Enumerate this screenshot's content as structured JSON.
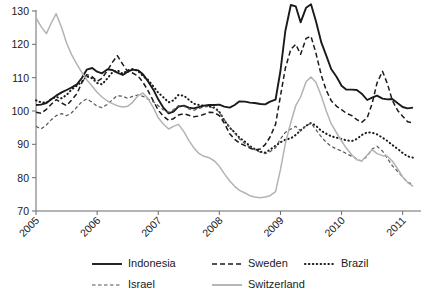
{
  "chart_data": {
    "type": "line",
    "title": "",
    "subtitle": "",
    "xlabel": "",
    "ylabel": "",
    "xlim": [
      2005.0,
      2011.3
    ],
    "ylim": [
      70,
      133
    ],
    "grid": false,
    "legend_position": "bottom",
    "xticks": [
      "2005",
      "2006",
      "2007",
      "2008",
      "2009",
      "2010",
      "2011"
    ],
    "xtick_values": [
      2005,
      2006,
      2007,
      2008,
      2009,
      2010,
      2011
    ],
    "yticks": [
      "70",
      "80",
      "90",
      "100",
      "110",
      "120",
      "130"
    ],
    "ytick_values": [
      70,
      80,
      90,
      100,
      110,
      120,
      130
    ],
    "colors": {
      "indonesia": "#1a1a1a",
      "sweden": "#1a1a1a",
      "brazil": "#1a1a1a",
      "israel": "#555555",
      "switzerland": "#b3b3b3",
      "axis": "#6b6b6b",
      "background": "#ffffff"
    },
    "series": [
      {
        "name": "Indonesia",
        "style": "solid",
        "color": "#1a1a1a",
        "width": 1.9,
        "x": [
          2005.0,
          2005.08,
          2005.17,
          2005.25,
          2005.33,
          2005.42,
          2005.5,
          2005.58,
          2005.67,
          2005.75,
          2005.83,
          2005.92,
          2006.0,
          2006.08,
          2006.17,
          2006.25,
          2006.33,
          2006.42,
          2006.5,
          2006.58,
          2006.67,
          2006.75,
          2006.83,
          2006.92,
          2007.0,
          2007.08,
          2007.17,
          2007.25,
          2007.33,
          2007.42,
          2007.5,
          2007.58,
          2007.67,
          2007.75,
          2007.83,
          2007.92,
          2008.0,
          2008.08,
          2008.17,
          2008.25,
          2008.33,
          2008.42,
          2008.5,
          2008.58,
          2008.67,
          2008.75,
          2008.83,
          2008.92,
          2009.0,
          2009.08,
          2009.17,
          2009.25,
          2009.33,
          2009.42,
          2009.5,
          2009.58,
          2009.67,
          2009.75,
          2009.83,
          2009.92,
          2010.0,
          2010.08,
          2010.17,
          2010.25,
          2010.33,
          2010.42,
          2010.5,
          2010.58,
          2010.67,
          2010.75,
          2010.83,
          2010.92,
          2011.0,
          2011.08,
          2011.17
        ],
        "values": [
          101.8,
          101.9,
          102.4,
          103.5,
          104.6,
          105.6,
          106.3,
          107.0,
          108.0,
          109.9,
          112.4,
          112.9,
          111.8,
          111.3,
          112.5,
          112.3,
          111.5,
          110.8,
          111.8,
          112.4,
          112.2,
          111.0,
          109.0,
          106.4,
          103.5,
          101.1,
          99.3,
          99.8,
          101.3,
          101.6,
          101.0,
          100.8,
          101.2,
          101.6,
          101.8,
          101.8,
          101.9,
          101.3,
          101.0,
          101.8,
          102.9,
          102.8,
          102.5,
          102.4,
          102.1,
          102.0,
          102.8,
          103.4,
          112.0,
          124.0,
          131.8,
          131.4,
          126.6,
          131.0,
          132.0,
          127.0,
          120.5,
          116.6,
          112.6,
          110.2,
          107.6,
          106.4,
          106.4,
          106.3,
          105.2,
          103.3,
          104.0,
          104.6,
          103.7,
          103.5,
          103.6,
          102.3,
          101.2,
          100.8,
          101.0
        ]
      },
      {
        "name": "Sweden",
        "style": "dashed",
        "color": "#1a1a1a",
        "width": 1.5,
        "dash": "5,3",
        "x": [
          2005.0,
          2005.08,
          2005.17,
          2005.25,
          2005.33,
          2005.42,
          2005.5,
          2005.58,
          2005.67,
          2005.75,
          2005.83,
          2005.92,
          2006.0,
          2006.08,
          2006.17,
          2006.25,
          2006.33,
          2006.42,
          2006.5,
          2006.58,
          2006.67,
          2006.75,
          2006.83,
          2006.92,
          2007.0,
          2007.08,
          2007.17,
          2007.25,
          2007.33,
          2007.42,
          2007.5,
          2007.58,
          2007.67,
          2007.75,
          2007.83,
          2007.92,
          2008.0,
          2008.08,
          2008.17,
          2008.25,
          2008.33,
          2008.42,
          2008.5,
          2008.58,
          2008.67,
          2008.75,
          2008.83,
          2008.92,
          2009.0,
          2009.08,
          2009.17,
          2009.25,
          2009.33,
          2009.42,
          2009.5,
          2009.58,
          2009.67,
          2009.75,
          2009.83,
          2009.92,
          2010.0,
          2010.08,
          2010.17,
          2010.25,
          2010.33,
          2010.42,
          2010.5,
          2010.58,
          2010.67,
          2010.75,
          2010.83,
          2010.92,
          2011.0,
          2011.08,
          2011.17
        ],
        "values": [
          99.6,
          99.3,
          100.5,
          102.0,
          103.4,
          102.4,
          101.6,
          103.2,
          105.2,
          108.5,
          110.9,
          110.3,
          108.9,
          109.8,
          112.2,
          114.6,
          116.6,
          114.0,
          111.8,
          111.4,
          110.5,
          108.6,
          106.2,
          103.0,
          100.3,
          98.5,
          97.2,
          97.7,
          98.8,
          99.2,
          98.7,
          98.3,
          98.5,
          99.0,
          99.6,
          99.5,
          98.6,
          96.4,
          93.2,
          91.5,
          90.4,
          89.6,
          88.9,
          88.3,
          88.6,
          89.9,
          92.2,
          96.0,
          104.5,
          112.8,
          118.5,
          120.0,
          117.0,
          121.8,
          122.4,
          117.4,
          110.6,
          106.2,
          103.1,
          101.4,
          100.4,
          99.3,
          98.6,
          97.4,
          96.6,
          98.0,
          102.2,
          108.4,
          111.9,
          108.2,
          103.2,
          100.1,
          98.4,
          96.8,
          96.4
        ]
      },
      {
        "name": "Brazil",
        "style": "dotted",
        "color": "#1a1a1a",
        "width": 2.0,
        "dash": "0.5,3.4",
        "x": [
          2005.0,
          2005.08,
          2005.17,
          2005.25,
          2005.33,
          2005.42,
          2005.5,
          2005.58,
          2005.67,
          2005.75,
          2005.83,
          2005.92,
          2006.0,
          2006.08,
          2006.17,
          2006.25,
          2006.33,
          2006.42,
          2006.5,
          2006.58,
          2006.67,
          2006.75,
          2006.83,
          2006.92,
          2007.0,
          2007.08,
          2007.17,
          2007.25,
          2007.33,
          2007.42,
          2007.5,
          2007.58,
          2007.67,
          2007.75,
          2007.83,
          2007.92,
          2008.0,
          2008.08,
          2008.17,
          2008.25,
          2008.33,
          2008.42,
          2008.5,
          2008.58,
          2008.67,
          2008.75,
          2008.83,
          2008.92,
          2009.0,
          2009.08,
          2009.17,
          2009.25,
          2009.33,
          2009.42,
          2009.5,
          2009.58,
          2009.67,
          2009.75,
          2009.83,
          2009.92,
          2010.0,
          2010.08,
          2010.17,
          2010.25,
          2010.33,
          2010.42,
          2010.5,
          2010.58,
          2010.67,
          2010.75,
          2010.83,
          2010.92,
          2011.0,
          2011.08,
          2011.17
        ],
        "values": [
          103.2,
          102.6,
          102.5,
          103.6,
          104.2,
          103.8,
          104.8,
          106.4,
          107.6,
          108.8,
          110.4,
          109.8,
          108.4,
          108.0,
          109.8,
          111.6,
          112.2,
          111.2,
          112.2,
          112.6,
          112.0,
          110.5,
          109.4,
          107.4,
          105.5,
          104.2,
          102.6,
          103.2,
          104.8,
          104.6,
          103.4,
          102.2,
          101.8,
          101.6,
          101.4,
          101.0,
          99.8,
          97.2,
          95.0,
          93.6,
          92.0,
          90.8,
          89.5,
          88.6,
          87.8,
          87.5,
          88.4,
          89.6,
          90.6,
          91.4,
          91.8,
          92.8,
          94.2,
          95.6,
          96.4,
          95.6,
          94.0,
          93.2,
          92.4,
          92.0,
          91.6,
          91.2,
          91.0,
          91.6,
          92.8,
          93.6,
          93.5,
          93.0,
          92.0,
          91.0,
          89.8,
          88.6,
          87.4,
          86.4,
          86.0
        ]
      },
      {
        "name": "Israel",
        "style": "fine-dashed",
        "color": "#555555",
        "width": 1.2,
        "dash": "3.5,2.5",
        "x": [
          2005.0,
          2005.08,
          2005.17,
          2005.25,
          2005.33,
          2005.42,
          2005.5,
          2005.58,
          2005.67,
          2005.75,
          2005.83,
          2005.92,
          2006.0,
          2006.08,
          2006.17,
          2006.25,
          2006.33,
          2006.42,
          2006.5,
          2006.58,
          2006.67,
          2006.75,
          2006.83,
          2006.92,
          2007.0,
          2007.08,
          2007.17,
          2007.25,
          2007.33,
          2007.42,
          2007.5,
          2007.58,
          2007.67,
          2007.75,
          2007.83,
          2007.92,
          2008.0,
          2008.08,
          2008.17,
          2008.25,
          2008.33,
          2008.42,
          2008.5,
          2008.58,
          2008.67,
          2008.75,
          2008.83,
          2008.92,
          2009.0,
          2009.08,
          2009.17,
          2009.25,
          2009.33,
          2009.42,
          2009.5,
          2009.58,
          2009.67,
          2009.75,
          2009.83,
          2009.92,
          2010.0,
          2010.08,
          2010.17,
          2010.25,
          2010.33,
          2010.42,
          2010.5,
          2010.58,
          2010.67,
          2010.75,
          2010.83,
          2010.92,
          2011.0,
          2011.08,
          2011.17
        ],
        "values": [
          95.4,
          94.6,
          95.8,
          97.4,
          98.6,
          99.2,
          98.6,
          99.4,
          101.2,
          102.8,
          103.6,
          102.6,
          101.4,
          101.0,
          102.0,
          103.4,
          104.6,
          104.4,
          103.8,
          104.4,
          104.8,
          104.4,
          103.6,
          102.8,
          101.6,
          100.4,
          99.6,
          100.4,
          101.6,
          101.4,
          100.6,
          100.2,
          100.8,
          101.2,
          101.4,
          100.8,
          99.6,
          97.4,
          95.2,
          93.4,
          91.6,
          90.2,
          89.2,
          88.4,
          87.6,
          87.2,
          87.8,
          89.0,
          91.6,
          93.6,
          94.6,
          95.4,
          94.0,
          95.6,
          96.4,
          94.4,
          92.2,
          90.6,
          89.4,
          88.6,
          88.0,
          87.2,
          86.4,
          85.6,
          85.0,
          86.4,
          88.6,
          89.4,
          88.0,
          85.8,
          83.6,
          81.8,
          80.2,
          78.6,
          78.0
        ]
      },
      {
        "name": "Switzerland",
        "style": "solid",
        "color": "#b3b3b3",
        "width": 1.5,
        "x": [
          2005.0,
          2005.08,
          2005.17,
          2005.25,
          2005.33,
          2005.42,
          2005.5,
          2005.58,
          2005.67,
          2005.75,
          2005.83,
          2005.92,
          2006.0,
          2006.08,
          2006.17,
          2006.25,
          2006.33,
          2006.42,
          2006.5,
          2006.58,
          2006.67,
          2006.75,
          2006.83,
          2006.92,
          2007.0,
          2007.08,
          2007.17,
          2007.25,
          2007.33,
          2007.42,
          2007.5,
          2007.58,
          2007.67,
          2007.75,
          2007.83,
          2007.92,
          2008.0,
          2008.08,
          2008.17,
          2008.25,
          2008.33,
          2008.42,
          2008.5,
          2008.58,
          2008.67,
          2008.75,
          2008.83,
          2008.92,
          2009.0,
          2009.08,
          2009.17,
          2009.25,
          2009.33,
          2009.42,
          2009.5,
          2009.58,
          2009.67,
          2009.75,
          2009.83,
          2009.92,
          2010.0,
          2010.08,
          2010.17,
          2010.25,
          2010.33,
          2010.42,
          2010.5,
          2010.58,
          2010.67,
          2010.75,
          2010.83,
          2010.92,
          2011.0,
          2011.08,
          2011.17
        ],
        "values": [
          128.0,
          125.4,
          123.2,
          126.4,
          129.2,
          125.0,
          120.4,
          117.0,
          114.0,
          111.6,
          109.4,
          107.4,
          105.6,
          104.2,
          103.0,
          102.2,
          101.6,
          101.2,
          101.4,
          102.6,
          104.6,
          105.4,
          103.8,
          101.0,
          98.0,
          96.2,
          94.6,
          95.4,
          96.0,
          93.8,
          91.2,
          89.0,
          87.2,
          86.4,
          86.0,
          85.0,
          83.4,
          81.2,
          79.0,
          77.4,
          76.2,
          75.4,
          74.6,
          74.2,
          74.0,
          74.2,
          74.6,
          75.8,
          82.4,
          90.2,
          96.6,
          101.6,
          104.2,
          108.8,
          110.2,
          108.6,
          104.4,
          100.0,
          96.2,
          93.4,
          91.0,
          88.8,
          86.8,
          85.4,
          85.0,
          86.8,
          88.4,
          87.2,
          86.6,
          86.4,
          85.0,
          82.6,
          80.2,
          78.6,
          77.4
        ]
      }
    ]
  },
  "legend": {
    "row1": [
      {
        "label": "Indonesia",
        "style": "solid",
        "color": "#1a1a1a"
      },
      {
        "label": "Sweden",
        "style": "dashed",
        "color": "#1a1a1a"
      },
      {
        "label": "Brazil",
        "style": "dotted",
        "color": "#1a1a1a"
      }
    ],
    "row2": [
      {
        "label": "Israel",
        "style": "fine-dashed",
        "color": "#555555"
      },
      {
        "label": "Switzerland",
        "style": "solid",
        "color": "#b3b3b3"
      }
    ]
  }
}
